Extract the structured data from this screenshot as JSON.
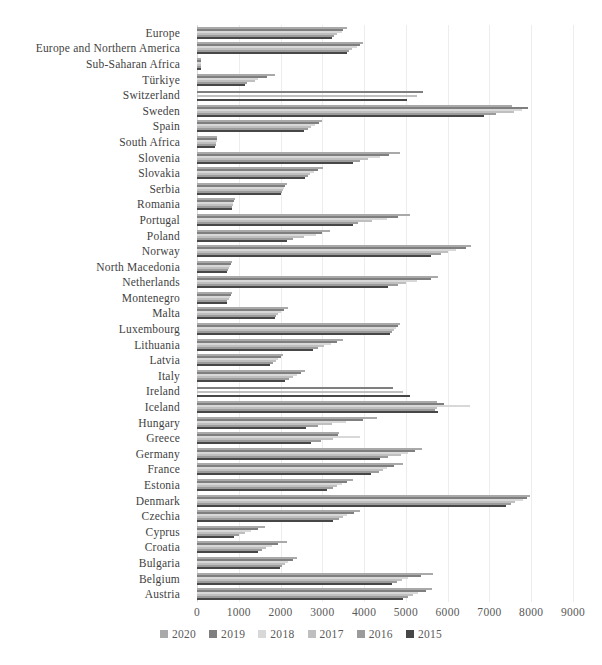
{
  "chart_data": {
    "type": "bar",
    "orientation": "horizontal",
    "title": "",
    "xlabel": "",
    "ylabel": "",
    "xlim": [
      0,
      9000
    ],
    "x_ticks": [
      "0",
      "1000",
      "2000",
      "3000",
      "4000",
      "5000",
      "6000",
      "7000",
      "8000",
      "9000"
    ],
    "grid": "vertical-light",
    "legend_position": "bottom",
    "series_labels": [
      "2020",
      "2019",
      "2018",
      "2017",
      "2016",
      "2015"
    ],
    "series_colors": [
      "#a9a9a9",
      "#7f7f7f",
      "#d8d8d8",
      "#bfbfbf",
      "#9b9b9b",
      "#474747"
    ],
    "missing_value": 0,
    "categories": [
      "Europe",
      "Europe and Northern America",
      "Sub-Saharan Africa",
      "Türkiye",
      "Switzerland",
      "Sweden",
      "Spain",
      "South Africa",
      "Slovenia",
      "Slovakia",
      "Serbia",
      "Romania",
      "Portugal",
      "Poland",
      "Norway",
      "North Macedonia",
      "Netherlands",
      "Montenegro",
      "Malta",
      "Luxembourg",
      "Lithuania",
      "Latvia",
      "Italy",
      "Ireland",
      "Iceland",
      "Hungary",
      "Greece",
      "Germany",
      "France",
      "Estonia",
      "Denmark",
      "Czechia",
      "Cyprus",
      "Croatia",
      "Bulgaria",
      "Belgium",
      "Austria"
    ],
    "series": [
      {
        "name": "2020",
        "values": [
          3580,
          3980,
          100,
          1870,
          0,
          7540,
          3000,
          490,
          4860,
          3010,
          2150,
          910,
          5100,
          3180,
          6570,
          830,
          5770,
          840,
          2180,
          4860,
          3500,
          2070,
          2580,
          0,
          5740,
          4300,
          3400,
          5390,
          4930,
          3740,
          7980,
          3900,
          1630,
          2150,
          2390,
          5650,
          5620
        ]
      },
      {
        "name": "2019",
        "values": [
          3500,
          3900,
          98,
          1670,
          5410,
          7930,
          2920,
          480,
          4600,
          2900,
          2110,
          890,
          4820,
          3000,
          6450,
          810,
          5600,
          810,
          2080,
          4820,
          3350,
          2000,
          2480,
          4700,
          5920,
          3970,
          3380,
          5210,
          4710,
          3600,
          7900,
          3750,
          1450,
          1950,
          2300,
          5350,
          5480
        ]
      },
      {
        "name": "2018",
        "values": [
          3460,
          3820,
          95,
          1460,
          0,
          7770,
          2830,
          470,
          4380,
          2800,
          2080,
          870,
          4540,
          2850,
          6210,
          790,
          5260,
          780,
          2000,
          4770,
          3200,
          1950,
          2400,
          0,
          6530,
          3560,
          3900,
          5040,
          4540,
          3460,
          7800,
          3600,
          1300,
          1800,
          2180,
          5050,
          5290
        ]
      },
      {
        "name": "2017",
        "values": [
          3350,
          3700,
          92,
          1390,
          5260,
          7590,
          2740,
          460,
          4100,
          2700,
          2060,
          850,
          4180,
          2550,
          6000,
          770,
          5000,
          760,
          1950,
          4720,
          3050,
          1880,
          2300,
          4940,
          5740,
          3240,
          3260,
          4890,
          4450,
          3350,
          7600,
          3500,
          1150,
          1650,
          2100,
          4900,
          5170
        ]
      },
      {
        "name": "2016",
        "values": [
          3280,
          3640,
          90,
          1200,
          0,
          7150,
          2650,
          450,
          3900,
          2650,
          2040,
          840,
          3860,
          2300,
          5850,
          750,
          4820,
          730,
          1900,
          4670,
          2900,
          1820,
          2200,
          0,
          5700,
          2900,
          2980,
          4580,
          4350,
          3250,
          7520,
          3400,
          1000,
          1550,
          2030,
          4780,
          5050
        ]
      },
      {
        "name": "2015",
        "values": [
          3230,
          3580,
          88,
          1150,
          5020,
          6870,
          2560,
          440,
          3740,
          2580,
          2020,
          830,
          3740,
          2150,
          5600,
          730,
          4580,
          710,
          1870,
          4620,
          2780,
          1750,
          2100,
          5100,
          5770,
          2600,
          2740,
          4380,
          4170,
          3110,
          7400,
          3250,
          890,
          1460,
          1990,
          4660,
          4930
        ]
      }
    ]
  }
}
